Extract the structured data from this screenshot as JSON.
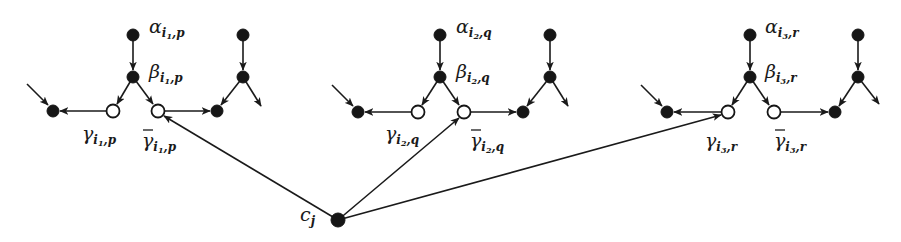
{
  "diagram": {
    "type": "directed-graph",
    "colors": {
      "stroke": "#1a1a1a",
      "filled_node": "#161616",
      "open_node": "#ffffff",
      "background": "#ffffff"
    },
    "clause_node": {
      "id": "c_j",
      "label": "c",
      "sub": "j",
      "x": 338,
      "y": 220
    },
    "groups": [
      {
        "id": "g1",
        "alpha": {
          "label": "α",
          "sub": "i",
          "subsub": "1",
          "tail": ",p",
          "x": 133,
          "y": 35
        },
        "beta": {
          "label": "β",
          "sub": "i",
          "subsub": "1",
          "tail": ",p",
          "x": 133,
          "y": 77
        },
        "gamma": {
          "label": "γ",
          "sub": "i",
          "subsub": "1",
          "tail": ",p",
          "x": 113,
          "y": 111
        },
        "gamma_bar": {
          "label": "γ̄",
          "sub": "i",
          "subsub": "1",
          "tail": ",p",
          "x": 158,
          "y": 111
        },
        "left_sink": {
          "x": 53,
          "y": 111
        },
        "left_in_tail": {
          "x": 27,
          "y": 84
        },
        "right_top": {
          "x": 243,
          "y": 35
        },
        "right_mid": {
          "x": 243,
          "y": 77
        },
        "right_sink": {
          "x": 217,
          "y": 111
        },
        "right_out_tip": {
          "x": 261,
          "y": 106
        },
        "clause_target": "gamma_bar"
      },
      {
        "id": "g2",
        "alpha": {
          "label": "α",
          "sub": "i",
          "subsub": "2",
          "tail": ",q",
          "x": 440,
          "y": 35
        },
        "beta": {
          "label": "β",
          "sub": "i",
          "subsub": "2",
          "tail": ",q",
          "x": 440,
          "y": 77
        },
        "gamma": {
          "label": "γ",
          "sub": "i",
          "subsub": "2",
          "tail": ",q",
          "x": 418,
          "y": 112
        },
        "gamma_bar": {
          "label": "γ̄",
          "sub": "i",
          "subsub": "2",
          "tail": ",q",
          "x": 464,
          "y": 112
        },
        "left_sink": {
          "x": 358,
          "y": 112
        },
        "left_in_tail": {
          "x": 332,
          "y": 85
        },
        "right_top": {
          "x": 550,
          "y": 35
        },
        "right_mid": {
          "x": 550,
          "y": 77
        },
        "right_sink": {
          "x": 523,
          "y": 112
        },
        "right_out_tip": {
          "x": 568,
          "y": 106
        },
        "clause_target": "gamma_bar"
      },
      {
        "id": "g3",
        "alpha": {
          "label": "α",
          "sub": "i",
          "subsub": "3",
          "tail": ",r",
          "x": 750,
          "y": 35
        },
        "beta": {
          "label": "β",
          "sub": "i",
          "subsub": "3",
          "tail": ",r",
          "x": 750,
          "y": 77
        },
        "gamma": {
          "label": "γ",
          "sub": "i",
          "subsub": "3",
          "tail": ",r",
          "x": 728,
          "y": 112
        },
        "gamma_bar": {
          "label": "γ̄",
          "sub": "i",
          "subsub": "3",
          "tail": ",r",
          "x": 774,
          "y": 112
        },
        "left_sink": {
          "x": 667,
          "y": 112
        },
        "left_in_tail": {
          "x": 641,
          "y": 85
        },
        "right_top": {
          "x": 858,
          "y": 35
        },
        "right_mid": {
          "x": 858,
          "y": 77
        },
        "right_sink": {
          "x": 835,
          "y": 112
        },
        "right_out_tip": {
          "x": 879,
          "y": 104
        },
        "clause_target": "gamma"
      }
    ],
    "labels": {
      "g1_alpha": "α",
      "g1_alpha_sub": "i",
      "g1_alpha_subsub": "1",
      "g1_alpha_tail": ",p",
      "g1_beta": "β",
      "g1_beta_sub": "i",
      "g1_beta_subsub": "1",
      "g1_beta_tail": ",p",
      "g1_gamma": "γ",
      "g1_gamma_sub": "i",
      "g1_gamma_subsub": "1",
      "g1_gamma_tail": ",p",
      "g1_gammabar": "γ",
      "g1_gammabar_sub": "i",
      "g1_gammabar_subsub": "1",
      "g1_gammabar_tail": ",p",
      "g2_alpha": "α",
      "g2_alpha_sub": "i",
      "g2_alpha_subsub": "2",
      "g2_alpha_tail": ",q",
      "g2_beta": "β",
      "g2_beta_sub": "i",
      "g2_beta_subsub": "2",
      "g2_beta_tail": ",q",
      "g2_gamma": "γ",
      "g2_gamma_sub": "i",
      "g2_gamma_subsub": "2",
      "g2_gamma_tail": ",q",
      "g2_gammabar": "γ",
      "g2_gammabar_sub": "i",
      "g2_gammabar_subsub": "2",
      "g2_gammabar_tail": ",q",
      "g3_alpha": "α",
      "g3_alpha_sub": "i",
      "g3_alpha_subsub": "3",
      "g3_alpha_tail": ",r",
      "g3_beta": "β",
      "g3_beta_sub": "i",
      "g3_beta_subsub": "3",
      "g3_beta_tail": ",r",
      "g3_gamma": "γ",
      "g3_gamma_sub": "i",
      "g3_gamma_subsub": "3",
      "g3_gamma_tail": ",r",
      "g3_gammabar": "γ",
      "g3_gammabar_sub": "i",
      "g3_gammabar_subsub": "3",
      "g3_gammabar_tail": ",r",
      "clause": "c",
      "clause_sub": "j"
    }
  }
}
